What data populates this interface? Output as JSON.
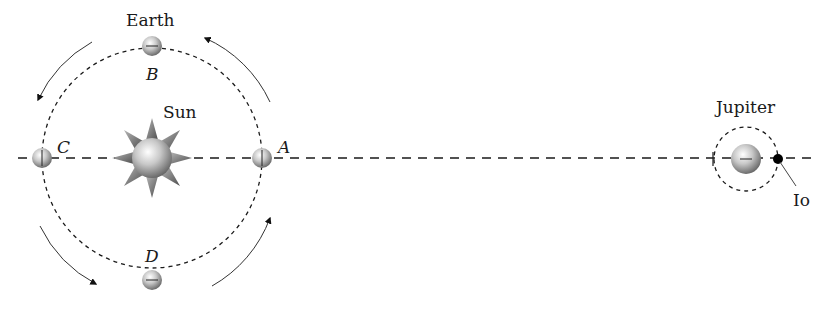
{
  "diagram": {
    "labels": {
      "earth": "Earth",
      "sun": "Sun",
      "jupiter": "Jupiter",
      "io": "Io",
      "point_a": "A",
      "point_b": "B",
      "point_c": "C",
      "point_d": "D"
    },
    "colors": {
      "line": "#1a1a1a",
      "arrow": "#333333",
      "planet_light": "#f4f4f4",
      "planet_dark": "#7a7a7a",
      "io": "#000000"
    }
  }
}
